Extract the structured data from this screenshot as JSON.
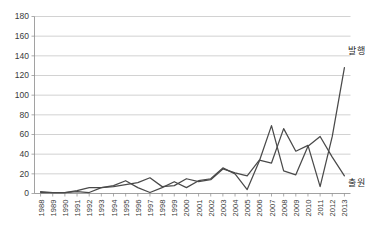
{
  "title": "",
  "chart_data": {
    "type": "line",
    "title": "",
    "subtitle": "",
    "xlabel": "",
    "ylabel": "",
    "ylim": [
      0,
      180
    ],
    "ytick_step": 20,
    "yticks": [
      0,
      20,
      40,
      60,
      80,
      100,
      120,
      140,
      160,
      180
    ],
    "grid": true,
    "legend_position": "right-inline",
    "categories": [
      "1988",
      "1989",
      "1990",
      "1991",
      "1992",
      "1993",
      "1994",
      "1995",
      "1996",
      "1997",
      "1998",
      "1999",
      "2000",
      "2001",
      "2002",
      "2003",
      "2004",
      "2005",
      "2006",
      "2007",
      "2008",
      "2009",
      "2010",
      "2011",
      "2012",
      "2013"
    ],
    "series": [
      {
        "name": "발행",
        "label_position": "upper-right",
        "color": "#4a4a4a",
        "values": [
          1,
          1,
          1,
          3,
          6,
          6,
          7,
          9,
          11,
          16,
          7,
          8,
          15,
          12,
          14,
          25,
          21,
          18,
          34,
          31,
          66,
          43,
          49,
          7,
          58,
          128
        ]
      },
      {
        "name": "출원",
        "label_position": "lower-right",
        "color": "#4a4a4a",
        "values": [
          2,
          1,
          1,
          2,
          1,
          6,
          8,
          13,
          6,
          1,
          6,
          12,
          6,
          13,
          15,
          26,
          20,
          4,
          33,
          69,
          23,
          19,
          48,
          58,
          37,
          18
        ]
      }
    ],
    "annotations": []
  },
  "axes": {
    "y_axis_name": "y-axis",
    "x_axis_name": "x-axis"
  }
}
